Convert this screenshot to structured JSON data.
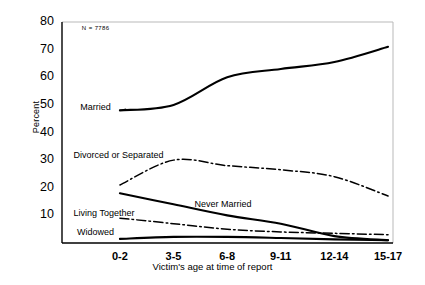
{
  "chart_data": {
    "type": "line",
    "title": "",
    "subtitle": "",
    "xlabel": "Victim's age at time of report",
    "ylabel": "Percent",
    "categories": [
      "0-2",
      "3-5",
      "6-8",
      "9-11",
      "12-14",
      "15-17"
    ],
    "xlim": [
      0,
      5
    ],
    "ylim": [
      0,
      80
    ],
    "yticks": [
      10,
      20,
      30,
      40,
      50,
      60,
      70,
      80
    ],
    "grid": false,
    "legend_position": "inline-annotations",
    "annotations": [
      {
        "name": "sample-size",
        "text": "N = 7786",
        "x_frac": 0.06,
        "y_value": 77
      }
    ],
    "series": [
      {
        "name": "Married",
        "style": "solid",
        "color": "#000000",
        "values": [
          48,
          50,
          60,
          63,
          65.5,
          71
        ],
        "label_position": {
          "x_frac": 0.055,
          "y_value": 48.5
        },
        "leader_line": true
      },
      {
        "name": "Divorced or Separated",
        "style": "dash-dot",
        "color": "#000000",
        "values": [
          21,
          30,
          28,
          26.5,
          24,
          17
        ],
        "label_position": {
          "x_frac": 0.035,
          "y_value": 31
        },
        "leader_line": false
      },
      {
        "name": "Never Married",
        "style": "solid",
        "color": "#000000",
        "values": [
          18,
          14,
          10,
          7,
          2.5,
          1
        ],
        "label_position": {
          "x_frac": 0.4,
          "y_value": 13.5
        },
        "leader_line": false
      },
      {
        "name": "Living Together",
        "style": "dash-dot",
        "color": "#000000",
        "values": [
          9,
          7,
          5,
          4,
          3.5,
          3
        ],
        "label_position": {
          "x_frac": 0.035,
          "y_value": 10
        },
        "leader_line": false
      },
      {
        "name": "Widowed",
        "style": "solid",
        "color": "#000000",
        "values": [
          1.5,
          2.2,
          2.2,
          1.8,
          1.3,
          1
        ],
        "label_position": {
          "x_frac": 0.045,
          "y_value": 3.4
        },
        "leader_line": false
      }
    ]
  },
  "axes": {
    "y_tick_labels": [
      "80",
      "70",
      "60",
      "50",
      "40",
      "30",
      "20",
      "10"
    ],
    "x_tick_labels": [
      "0-2",
      "3-5",
      "6-8",
      "9-11",
      "12-14",
      "15-17"
    ],
    "y_axis_title": "Percent",
    "x_axis_title": "Victim's age at time of report"
  },
  "labels": {
    "married": "Married",
    "divorced_or_separated": "Divorced or Separated",
    "never_married": "Never Married",
    "living_together": "Living Together",
    "widowed": "Widowed",
    "sample_size": "N = 7786"
  }
}
